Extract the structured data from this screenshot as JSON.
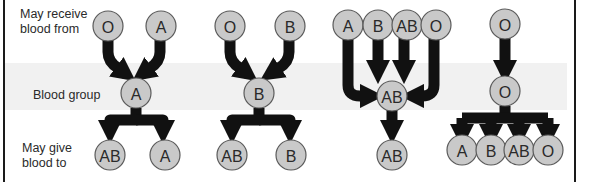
{
  "labels": {
    "receive": "May receive\nblood from",
    "receive_line1": "May receive",
    "receive_line2": "blood from",
    "group": "Blood group",
    "give_line1": "May give",
    "give_line2": "blood to"
  },
  "colors": {
    "circle_fill": "#c9c9c9",
    "circle_stroke": "#5a5a5a",
    "arrow": "#111111",
    "band": "#f1f1f1",
    "border": "#1a1a1a"
  },
  "groups": [
    {
      "group": "A",
      "receive_from": [
        "O",
        "A"
      ],
      "give_to": [
        "AB",
        "A"
      ]
    },
    {
      "group": "B",
      "receive_from": [
        "O",
        "B"
      ],
      "give_to": [
        "AB",
        "B"
      ]
    },
    {
      "group": "AB",
      "receive_from": [
        "A",
        "B",
        "AB",
        "O"
      ],
      "give_to": [
        "AB"
      ]
    },
    {
      "group": "O",
      "receive_from": [
        "O"
      ],
      "give_to": [
        "A",
        "B",
        "AB",
        "O"
      ]
    }
  ]
}
